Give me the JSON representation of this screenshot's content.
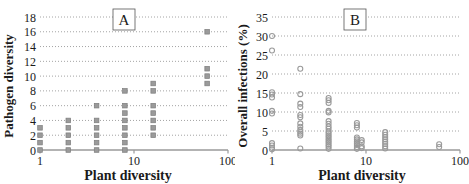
{
  "figure": {
    "background": "#ffffff",
    "gridline_color": "#8c8c8c",
    "axis_color": "#9a9a9a",
    "text_color": "#1a1a1a",
    "marker_color": "#9a9a9a"
  },
  "chart_data": [
    {
      "id": "A",
      "type": "scatter",
      "panel_label": "A",
      "title": "",
      "xlabel": "Plant diversity",
      "ylabel": "Pathogen diversity",
      "xscale": "log",
      "xlim": [
        1,
        100
      ],
      "ylim": [
        0,
        18
      ],
      "xticks": [
        1,
        10,
        100
      ],
      "xticklabels": [
        "1",
        "10",
        "100"
      ],
      "yticks": [
        0,
        2,
        4,
        6,
        8,
        10,
        12,
        14,
        16,
        18
      ],
      "yticklabels": [
        "0",
        "2",
        "4",
        "6",
        "8",
        "10",
        "12",
        "14",
        "16",
        "18"
      ],
      "grid": true,
      "grid_axis": "y",
      "marker": "filled-square",
      "marker_color": "#9a9a9a",
      "legend": "none",
      "points": [
        {
          "x": 1,
          "y": 0
        },
        {
          "x": 1,
          "y": 1
        },
        {
          "x": 1,
          "y": 2
        },
        {
          "x": 1,
          "y": 3
        },
        {
          "x": 2,
          "y": 0
        },
        {
          "x": 2,
          "y": 1
        },
        {
          "x": 2,
          "y": 2
        },
        {
          "x": 2,
          "y": 3
        },
        {
          "x": 2,
          "y": 4
        },
        {
          "x": 4,
          "y": 0
        },
        {
          "x": 4,
          "y": 1
        },
        {
          "x": 4,
          "y": 2
        },
        {
          "x": 4,
          "y": 3
        },
        {
          "x": 4,
          "y": 4
        },
        {
          "x": 4,
          "y": 6
        },
        {
          "x": 8,
          "y": 0
        },
        {
          "x": 8,
          "y": 1
        },
        {
          "x": 8,
          "y": 2
        },
        {
          "x": 8,
          "y": 3
        },
        {
          "x": 8,
          "y": 4
        },
        {
          "x": 8,
          "y": 5
        },
        {
          "x": 8,
          "y": 6
        },
        {
          "x": 8,
          "y": 8
        },
        {
          "x": 16,
          "y": 2
        },
        {
          "x": 16,
          "y": 3
        },
        {
          "x": 16,
          "y": 4
        },
        {
          "x": 16,
          "y": 5
        },
        {
          "x": 16,
          "y": 6
        },
        {
          "x": 16,
          "y": 8
        },
        {
          "x": 16,
          "y": 9
        },
        {
          "x": 60,
          "y": 9
        },
        {
          "x": 60,
          "y": 10
        },
        {
          "x": 60,
          "y": 11
        },
        {
          "x": 60,
          "y": 16
        }
      ]
    },
    {
      "id": "B",
      "type": "scatter",
      "panel_label": "B",
      "title": "",
      "xlabel": "Plant diversity",
      "ylabel": "Overall infections (%)",
      "xscale": "log",
      "xlim": [
        1,
        100
      ],
      "ylim": [
        0,
        35
      ],
      "xticks": [
        1,
        10,
        100
      ],
      "xticklabels": [
        "1",
        "10",
        "100"
      ],
      "yticks": [
        0,
        5,
        10,
        15,
        20,
        25,
        30,
        35
      ],
      "yticklabels": [
        "0",
        "5",
        "10",
        "15",
        "20",
        "25",
        "30",
        "35"
      ],
      "grid": true,
      "grid_axis": "y",
      "marker": "open-circle",
      "marker_color": "#9a9a9a",
      "legend": "none",
      "points": [
        {
          "x": 1,
          "y": 0.2
        },
        {
          "x": 1,
          "y": 0.6
        },
        {
          "x": 1,
          "y": 1.2
        },
        {
          "x": 1,
          "y": 1.8
        },
        {
          "x": 1,
          "y": 9.6
        },
        {
          "x": 1,
          "y": 10.3
        },
        {
          "x": 1,
          "y": 13.8
        },
        {
          "x": 1,
          "y": 14.6
        },
        {
          "x": 1,
          "y": 15.2
        },
        {
          "x": 1,
          "y": 26.2
        },
        {
          "x": 1,
          "y": 30.0
        },
        {
          "x": 2,
          "y": 0.4
        },
        {
          "x": 2,
          "y": 3.8
        },
        {
          "x": 2,
          "y": 4.3
        },
        {
          "x": 2,
          "y": 4.8
        },
        {
          "x": 2,
          "y": 5.3
        },
        {
          "x": 2,
          "y": 6.1
        },
        {
          "x": 2,
          "y": 7.0
        },
        {
          "x": 2,
          "y": 8.6
        },
        {
          "x": 2,
          "y": 9.2
        },
        {
          "x": 2,
          "y": 11.3
        },
        {
          "x": 2,
          "y": 12.2
        },
        {
          "x": 2,
          "y": 14.7
        },
        {
          "x": 2,
          "y": 21.4
        },
        {
          "x": 4,
          "y": 0.3
        },
        {
          "x": 4,
          "y": 0.9
        },
        {
          "x": 4,
          "y": 1.4
        },
        {
          "x": 4,
          "y": 1.9
        },
        {
          "x": 4,
          "y": 2.4
        },
        {
          "x": 4,
          "y": 2.9
        },
        {
          "x": 4,
          "y": 3.4
        },
        {
          "x": 4,
          "y": 3.9
        },
        {
          "x": 4,
          "y": 4.4
        },
        {
          "x": 4,
          "y": 4.9
        },
        {
          "x": 4,
          "y": 5.6
        },
        {
          "x": 4,
          "y": 6.2
        },
        {
          "x": 4,
          "y": 6.9
        },
        {
          "x": 4,
          "y": 7.6
        },
        {
          "x": 4,
          "y": 9.9
        },
        {
          "x": 4,
          "y": 10.3
        },
        {
          "x": 4,
          "y": 12.4
        },
        {
          "x": 4,
          "y": 13.1
        },
        {
          "x": 4,
          "y": 13.7
        },
        {
          "x": 8,
          "y": 0.3
        },
        {
          "x": 8,
          "y": 0.8
        },
        {
          "x": 8,
          "y": 1.3
        },
        {
          "x": 8,
          "y": 1.8
        },
        {
          "x": 8,
          "y": 2.3
        },
        {
          "x": 8,
          "y": 2.8
        },
        {
          "x": 8,
          "y": 3.3
        },
        {
          "x": 8,
          "y": 5.9
        },
        {
          "x": 8,
          "y": 6.5
        },
        {
          "x": 8,
          "y": 7.1
        },
        {
          "x": 9,
          "y": 0.5
        },
        {
          "x": 9,
          "y": 1.0
        },
        {
          "x": 9,
          "y": 2.0
        },
        {
          "x": 9,
          "y": 2.6
        },
        {
          "x": 16,
          "y": 0.4
        },
        {
          "x": 16,
          "y": 1.0
        },
        {
          "x": 16,
          "y": 1.6
        },
        {
          "x": 16,
          "y": 2.2
        },
        {
          "x": 16,
          "y": 2.8
        },
        {
          "x": 16,
          "y": 3.4
        },
        {
          "x": 16,
          "y": 4.0
        },
        {
          "x": 16,
          "y": 4.7
        },
        {
          "x": 60,
          "y": 0.8
        },
        {
          "x": 60,
          "y": 1.5
        }
      ]
    }
  ]
}
